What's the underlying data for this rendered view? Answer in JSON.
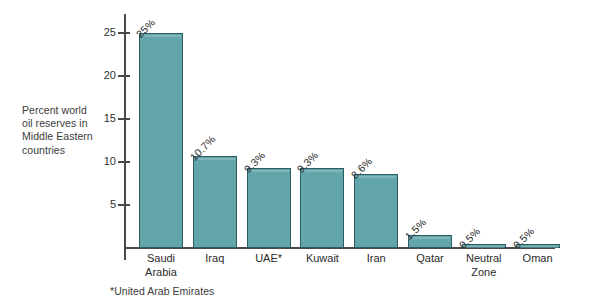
{
  "chart_data": {
    "type": "bar",
    "title": "",
    "xlabel": "",
    "ylabel": "Percent world oil reserves in Middle Eastern countries",
    "categories": [
      "Saudi Arabia",
      "Iraq",
      "UAE*",
      "Kuwait",
      "Iran",
      "Qatar",
      "Neutral Zone",
      "Oman"
    ],
    "values": [
      25,
      10.7,
      9.3,
      9.3,
      8.6,
      1.5,
      0.5,
      0.5
    ],
    "data_labels": [
      "25%",
      "10.7%",
      "9.3%",
      "9.3%",
      "8.6%",
      "1.5%",
      "0.5%",
      "0.5%"
    ],
    "ylim": [
      0,
      27
    ],
    "yticks": [
      5,
      10,
      15,
      20,
      25
    ],
    "ytick_labels": [
      "5",
      "10",
      "15",
      "20",
      "25"
    ],
    "grid": false,
    "legend": null,
    "bar_color": "#62a6ab",
    "bar_edge_color": "#2d5c60",
    "axis_color": "#4a4a4a",
    "background": "#ffffff"
  },
  "axis_label": {
    "line1": "Percent world",
    "line2": "oil reserves in",
    "line3": "Middle Eastern",
    "line4": "countries"
  },
  "footnote": {
    "text": "*United Arab Emirates"
  }
}
